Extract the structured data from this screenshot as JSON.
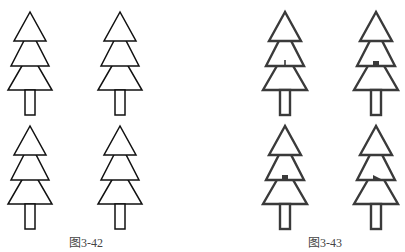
{
  "figures": [
    {
      "id": "left",
      "caption": "图3-42",
      "caption_x": 86,
      "caption_y": 233,
      "stroke": "#111111",
      "stroke_width": 1.5,
      "trees": [
        {
          "cx": 30,
          "top": 12,
          "notch": "none"
        },
        {
          "cx": 120,
          "top": 12,
          "notch": "none"
        },
        {
          "cx": 30,
          "top": 126,
          "notch": "none"
        },
        {
          "cx": 120,
          "top": 126,
          "notch": "none"
        }
      ]
    },
    {
      "id": "right",
      "caption": "图3-43",
      "caption_x": 325,
      "caption_y": 233,
      "stroke": "#3a3a3a",
      "stroke_width": 2.4,
      "trees": [
        {
          "cx": 285,
          "top": 12,
          "notch": "spike"
        },
        {
          "cx": 376,
          "top": 12,
          "notch": "square"
        },
        {
          "cx": 285,
          "top": 126,
          "notch": "square"
        },
        {
          "cx": 376,
          "top": 126,
          "notch": "flag"
        }
      ]
    }
  ]
}
